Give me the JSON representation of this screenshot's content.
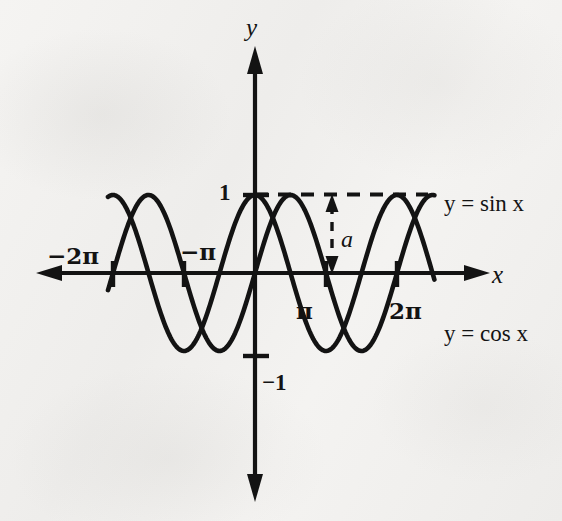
{
  "figure": {
    "kind": "math-graph",
    "background_color": "#f3f2f0",
    "ink_color": "#131313"
  },
  "axes": {
    "x_label": "x",
    "y_label": "y",
    "origin_px": [
      255,
      273
    ],
    "pi_spacing_px": 71,
    "amplitude_px": 78
  },
  "x_ticks": [
    {
      "label": "−2π",
      "value": -6.2832
    },
    {
      "label": "−π",
      "value": -3.1416
    },
    {
      "label": "π",
      "value": 3.1416
    },
    {
      "label": "2π",
      "value": 6.2832
    }
  ],
  "y_ticks": [
    {
      "label": "1",
      "value": 1
    },
    {
      "label": "−1",
      "value": -1
    }
  ],
  "curve_labels": {
    "sine": "y = sin x",
    "cosine": "y = cos x"
  },
  "annotations": {
    "amplitude_symbol": "a",
    "amplitude_note": "vertical double arrow from y = 1 down to the x-axis",
    "dashed_level": "y = 1"
  },
  "chart_data": {
    "type": "line",
    "title": "",
    "xlabel": "x",
    "ylabel": "y",
    "xlim": [
      -7.4,
      6.9
    ],
    "ylim": [
      -1.35,
      1.35
    ],
    "grid": false,
    "legend": "inline-right",
    "x_tick_labels": [
      "−2π",
      "−π",
      "π",
      "2π"
    ],
    "x_tick_values": [
      -6.2832,
      -3.1416,
      3.1416,
      6.2832
    ],
    "y_tick_labels": [
      "1",
      "−1"
    ],
    "y_tick_values": [
      1,
      -1
    ],
    "series": [
      {
        "name": "y = sin x",
        "formula": "sin(x)",
        "amplitude": 1,
        "period": 6.2832,
        "phase": 0
      },
      {
        "name": "y = cos x",
        "formula": "cos(x)",
        "amplitude": 1,
        "period": 6.2832,
        "phase": 1.5708
      }
    ],
    "annotations": [
      {
        "text": "a",
        "type": "amplitude-arrow",
        "from": [
          3.9,
          1
        ],
        "to": [
          3.9,
          0
        ],
        "value": 1
      },
      {
        "text": "",
        "type": "dashed-line",
        "y": 1,
        "x_from": 0,
        "x_to": 6.2832
      }
    ]
  }
}
